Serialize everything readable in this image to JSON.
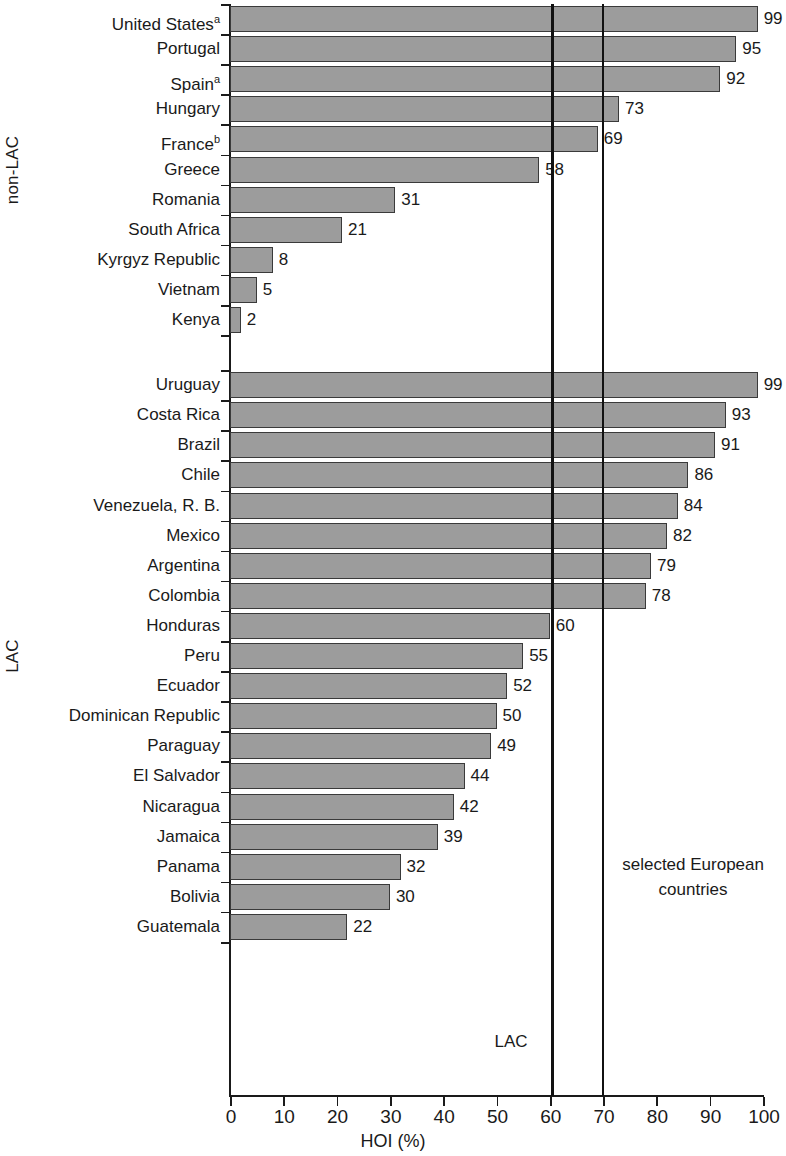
{
  "chart_data": {
    "type": "bar",
    "orientation": "horizontal",
    "title": "",
    "xlabel": "HOI (%)",
    "ylabel": "",
    "xlim": [
      0,
      100
    ],
    "xticks": [
      0,
      10,
      20,
      30,
      40,
      50,
      60,
      70,
      80,
      90,
      100
    ],
    "grid": false,
    "legend": false,
    "bar_color": "#9c9c9c",
    "bar_edge_color": "#3a3a3a",
    "groups": [
      {
        "name": "non-LAC",
        "categories": [
          "United States",
          "Portugal",
          "Spain",
          "Hungary",
          "France",
          "Greece",
          "Romania",
          "South Africa",
          "Kyrgyz Republic",
          "Vietnam",
          "Kenya"
        ],
        "footnotes": [
          "a",
          "",
          "a",
          "",
          "b",
          "",
          "",
          "",
          "",
          "",
          ""
        ],
        "values": [
          99,
          95,
          92,
          73,
          69,
          58,
          31,
          21,
          8,
          5,
          2
        ]
      },
      {
        "name": "LAC",
        "categories": [
          "Uruguay",
          "Costa Rica",
          "Brazil",
          "Chile",
          "Venezuela, R. B.",
          "Mexico",
          "Argentina",
          "Colombia",
          "Honduras",
          "Peru",
          "Ecuador",
          "Dominican Republic",
          "Paraguay",
          "El Salvador",
          "Nicaragua",
          "Jamaica",
          "Panama",
          "Bolivia",
          "Guatemala"
        ],
        "footnotes": [
          "",
          "",
          "",
          "",
          "",
          "",
          "",
          "",
          "",
          "",
          "",
          "",
          "",
          "",
          "",
          "",
          "",
          "",
          ""
        ],
        "values": [
          99,
          93,
          91,
          86,
          84,
          82,
          79,
          78,
          60,
          55,
          52,
          50,
          49,
          44,
          42,
          39,
          32,
          30,
          22
        ]
      }
    ],
    "reference_lines": [
      {
        "label": "LAC",
        "value": 60.5
      },
      {
        "label": "selected European countries",
        "value": 70
      }
    ],
    "annotations": [
      {
        "text": "LAC",
        "value": 60.5
      },
      {
        "text": "selected European",
        "value": 70
      },
      {
        "text": "countries",
        "value": 70
      }
    ]
  }
}
